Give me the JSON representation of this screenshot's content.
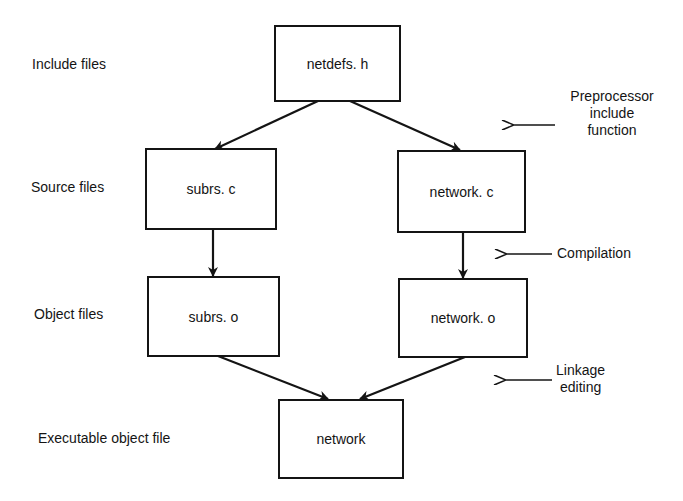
{
  "diagram": {
    "row_labels": {
      "include": "Include files",
      "source": "Source files",
      "object": "Object files",
      "executable": "Executable object file"
    },
    "nodes": {
      "netdefs_h": "netdefs. h",
      "subrs_c": "subrs. c",
      "network_c": "network. c",
      "subrs_o": "subrs. o",
      "network_o": "network. o",
      "network": "network"
    },
    "annotations": {
      "preprocessor": [
        "Preprocessor",
        "include",
        "function"
      ],
      "compilation": "Compilation",
      "linkage": [
        "Linkage",
        "editing"
      ]
    },
    "edges": [
      {
        "from": "netdefs_h",
        "to": "subrs_c"
      },
      {
        "from": "netdefs_h",
        "to": "network_c"
      },
      {
        "from": "subrs_c",
        "to": "subrs_o"
      },
      {
        "from": "network_c",
        "to": "network_o"
      },
      {
        "from": "subrs_o",
        "to": "network"
      },
      {
        "from": "network_o",
        "to": "network"
      }
    ],
    "colors": {
      "ink": "#141414",
      "background": "#ffffff"
    }
  }
}
